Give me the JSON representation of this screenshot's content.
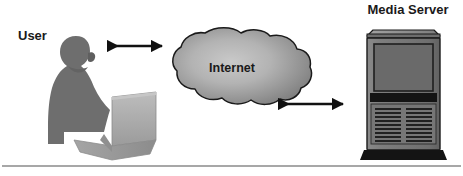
{
  "diagram": {
    "background_color": "#ffffff",
    "nodes": [
      {
        "id": "user",
        "label": "User",
        "icon": "person-at-laptop-icon",
        "label_x": 18,
        "label_y": 40,
        "colors": {
          "person": "#6e6e6e",
          "laptop": "#a8a8a8",
          "laptop_shade": "#8f8f8f"
        }
      },
      {
        "id": "internet",
        "label": "Internet",
        "icon": "cloud-icon",
        "label_x": 232,
        "label_y": 72,
        "colors": {
          "fill_center": "#bdbdbd",
          "fill_edge": "#7d7d7d",
          "outline": "#1a1a1a"
        }
      },
      {
        "id": "media-server",
        "label": "Media Server",
        "icon": "server-tower-icon",
        "label_x": 408,
        "label_y": 14,
        "colors": {
          "body": "#7b7b7b",
          "panel": "#6a6a6a",
          "outline": "#1a1a1a",
          "base": "#141414"
        }
      }
    ],
    "connectors": [
      {
        "id": "user-internet-link",
        "name": "user-to-internet-arrow",
        "style": "double-headed-arrow",
        "from": "user",
        "to": "internet",
        "x1": 106,
        "x2": 164,
        "y": 46,
        "color": "#111111"
      },
      {
        "id": "internet-server-link",
        "name": "internet-to-server-arrow",
        "style": "double-headed-arrow",
        "from": "internet",
        "to": "media-server",
        "x1": 277,
        "x2": 345,
        "y": 104,
        "color": "#111111"
      }
    ],
    "footer_rule": {
      "name": "footer-divider",
      "y": 166,
      "x1": 2,
      "x2": 461,
      "color": "#8a8a8a",
      "thickness": 1.6
    },
    "server_detail": {
      "slot_rows": 9,
      "slot_columns": 2
    }
  }
}
